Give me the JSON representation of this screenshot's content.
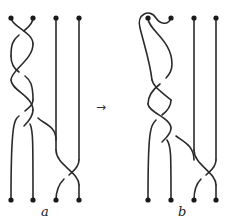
{
  "figure": {
    "panels": [
      {
        "id": "a",
        "label": "a"
      },
      {
        "id": "b",
        "label": "b"
      }
    ],
    "arrow": "→",
    "colors": {
      "strand": "#2a2a2a",
      "dot": "#1a1a1a",
      "background": "#ffffff"
    }
  }
}
